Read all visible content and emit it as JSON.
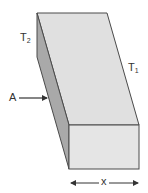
{
  "diagram": {
    "type": "heat-conduction-slab",
    "labels": {
      "t2": {
        "main": "T",
        "sub": "2"
      },
      "t1": {
        "main": "T",
        "sub": "1"
      },
      "area": "A",
      "thickness": "x"
    },
    "colors": {
      "top_face": "#e0e0e0",
      "side_face": "#a9a9a9",
      "front_face": "#e5e5e5",
      "outline": "#4a4a4a",
      "arrow": "#333333",
      "background": "#ffffff"
    }
  }
}
